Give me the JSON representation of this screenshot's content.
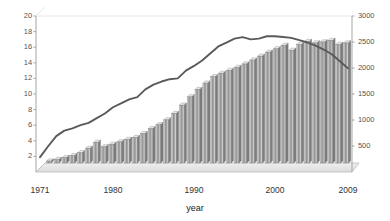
{
  "chart_data": {
    "type": "bar",
    "title": "",
    "xlabel": "year",
    "ylabel": "",
    "grid": false,
    "legend": "none",
    "x": [
      1971,
      1972,
      1973,
      1974,
      1975,
      1976,
      1977,
      1978,
      1979,
      1980,
      1981,
      1982,
      1983,
      1984,
      1985,
      1986,
      1987,
      1988,
      1989,
      1990,
      1991,
      1992,
      1993,
      1994,
      1995,
      1996,
      1997,
      1998,
      1999,
      2000,
      2001,
      2002,
      2003,
      2004,
      2005,
      2006,
      2007,
      2008,
      2009
    ],
    "xtick_labels": [
      "1971",
      "1980",
      "1990",
      "2000",
      "2009"
    ],
    "xtick_years": [
      1971,
      1980,
      1990,
      2000,
      2009
    ],
    "left_axis": {
      "min": 0,
      "max": 20,
      "ticks": [
        2,
        4,
        6,
        8,
        10,
        12,
        14,
        16,
        18,
        20
      ],
      "tick_labels": [
        "2",
        "4",
        "6",
        "8",
        "10",
        "12",
        "14",
        "16",
        "18",
        "20"
      ]
    },
    "right_axis": {
      "min": 0,
      "max": 3000,
      "ticks": [
        500,
        1000,
        1500,
        2000,
        2500,
        3000
      ],
      "tick_labels": [
        "500",
        "1000",
        "1500",
        "2000",
        "2500",
        "3000"
      ]
    },
    "series": [
      {
        "name": "bars",
        "type": "bar",
        "axis": "right",
        "color": "#9a9a9a",
        "values": [
          40,
          70,
          110,
          150,
          210,
          300,
          420,
          330,
          380,
          430,
          480,
          520,
          600,
          700,
          780,
          880,
          1010,
          1180,
          1350,
          1500,
          1630,
          1760,
          1830,
          1890,
          1950,
          2020,
          2100,
          2180,
          2260,
          2330,
          2400,
          2300,
          2420,
          2480,
          2450,
          2470,
          2500,
          2420,
          2450
        ]
      },
      {
        "name": "line",
        "type": "line",
        "axis": "left",
        "color": "#5a5a5a",
        "values": [
          1.9,
          3.3,
          4.6,
          5.3,
          5.6,
          6.0,
          6.3,
          6.9,
          7.5,
          8.3,
          8.8,
          9.3,
          9.6,
          10.6,
          11.2,
          11.6,
          11.9,
          12.0,
          13.0,
          13.6,
          14.3,
          15.2,
          16.1,
          16.6,
          17.1,
          17.3,
          17.0,
          17.1,
          17.4,
          17.4,
          17.3,
          17.2,
          16.9,
          16.6,
          16.2,
          15.7,
          15.1,
          14.2,
          13.3
        ]
      }
    ]
  },
  "colors": {
    "bar_fill": "#9a9a9a",
    "bar_light": "#d8d8d8",
    "bar_dark": "#6f6f6f",
    "line": "#5a5a5a",
    "axis": "#9a9a9a",
    "text": "#444444",
    "floor": "#e2e2e2"
  }
}
